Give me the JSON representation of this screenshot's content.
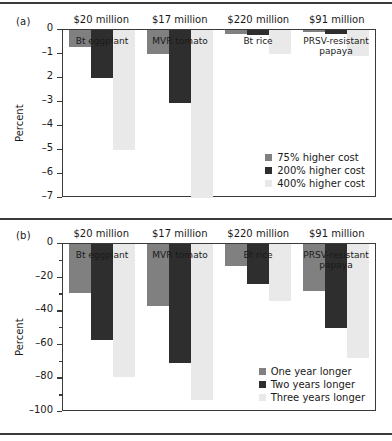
{
  "figure": {
    "panels": [
      {
        "tag": "(a)",
        "ylabel": "Percent",
        "ymin": -7,
        "ymax": 0,
        "ticks": [
          {
            "value": 0,
            "label": "0",
            "major": true
          },
          {
            "value": -1,
            "label": "–1",
            "major": true
          },
          {
            "value": -2,
            "label": "2",
            "major": true
          },
          {
            "value": -3,
            "label": "–3",
            "major": true
          },
          {
            "value": -4,
            "label": "–4",
            "major": true
          },
          {
            "value": -5,
            "label": "–5",
            "major": true
          },
          {
            "value": -6,
            "label": "–6",
            "major": true
          },
          {
            "value": -7,
            "label": "–7",
            "major": true
          }
        ],
        "headers": [
          "$20 million",
          "$17 million",
          "$220 million",
          "$91 million"
        ],
        "groups": [
          "Bt eggplant",
          "MVR tomato",
          "Bt rice",
          "PRSV-resistant papaya"
        ],
        "legend": [
          "75% higher cost",
          "200% higher cost",
          "400% higher cost"
        ]
      },
      {
        "tag": "(b)",
        "ylabel": "Percent",
        "ymin": -100,
        "ymax": 0,
        "ticks": [
          {
            "value": 0,
            "label": "0",
            "major": true
          },
          {
            "value": -10,
            "label": "",
            "major": false
          },
          {
            "value": -20,
            "label": "–20",
            "major": true
          },
          {
            "value": -30,
            "label": "",
            "major": false
          },
          {
            "value": -40,
            "label": "–40",
            "major": true
          },
          {
            "value": -50,
            "label": "",
            "major": false
          },
          {
            "value": -60,
            "label": "–60",
            "major": true
          },
          {
            "value": -70,
            "label": "",
            "major": false
          },
          {
            "value": -80,
            "label": "–80",
            "major": true
          },
          {
            "value": -90,
            "label": "",
            "major": false
          },
          {
            "value": -100,
            "label": "–100",
            "major": true
          }
        ],
        "headers": [
          "$20 million",
          "$17 million",
          "$220 million",
          "$91 million"
        ],
        "groups": [
          "Bt eggplant",
          "MVR tomato",
          "Bt rice",
          "PRSV-resistant papaya"
        ],
        "legend": [
          "One year longer",
          "Two years longer",
          "Three years longer"
        ]
      }
    ]
  },
  "chart_data": [
    {
      "type": "bar",
      "panel": "(a)",
      "title": "",
      "xlabel": "",
      "ylabel": "Percent",
      "ylim": [
        -7,
        0
      ],
      "grid": false,
      "legend_position": "inside bottom-right",
      "categories": [
        "Bt eggplant",
        "MVR tomato",
        "Bt rice",
        "PRSV-resistant papaya"
      ],
      "category_headers": [
        "$20 million",
        "$17 million",
        "$220 million",
        "$91 million"
      ],
      "series": [
        {
          "name": "75% higher cost",
          "color": "#808080",
          "values": [
            -0.7,
            -1.0,
            -0.15,
            -0.1
          ]
        },
        {
          "name": "200% higher cost",
          "color": "#2e2e2e",
          "values": [
            -2.0,
            -3.05,
            -0.2,
            -0.15
          ]
        },
        {
          "name": "400% higher cost",
          "color": "#e9e9e9",
          "values": [
            -5.0,
            -7.0,
            -1.0,
            -1.1
          ]
        }
      ]
    },
    {
      "type": "bar",
      "panel": "(b)",
      "title": "",
      "xlabel": "",
      "ylabel": "Percent",
      "ylim": [
        -100,
        0
      ],
      "grid": false,
      "legend_position": "inside bottom-right",
      "categories": [
        "Bt eggplant",
        "MVR tomato",
        "Bt rice",
        "PRSV-resistant papaya"
      ],
      "category_headers": [
        "$20 million",
        "$17 million",
        "$220 million",
        "$91 million"
      ],
      "series": [
        {
          "name": "One year longer",
          "color": "#808080",
          "values": [
            -29,
            -37,
            -13,
            -28
          ]
        },
        {
          "name": "Two years longer",
          "color": "#2e2e2e",
          "values": [
            -57,
            -71,
            -24,
            -50
          ]
        },
        {
          "name": "Three years longer",
          "color": "#e9e9e9",
          "values": [
            -79,
            -93,
            -34,
            -68
          ]
        }
      ]
    }
  ]
}
